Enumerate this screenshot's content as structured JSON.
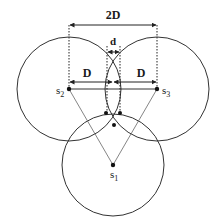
{
  "diagram": {
    "labels": {
      "two_d": "2D",
      "d": "d",
      "d_left": "D",
      "d_right": "D"
    },
    "sensors": [
      {
        "name": "s",
        "sub": "1"
      },
      {
        "name": "s",
        "sub": "2"
      },
      {
        "name": "s",
        "sub": "3"
      }
    ],
    "colors": {
      "stroke": "#333333",
      "thin": "#555555",
      "background": "#ffffff"
    }
  }
}
